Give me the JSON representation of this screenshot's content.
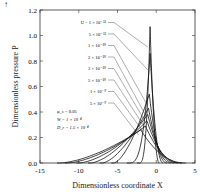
{
  "chart_data": {
    "type": "line",
    "title": "",
    "xlabel": "Dimensionless coordinate X",
    "ylabel": "Dimensionless pressure P",
    "xlim": [
      -15,
      5
    ],
    "ylim": [
      0,
      1.2
    ],
    "x_ticks": [
      "-15",
      "-10",
      "-5",
      "0",
      "5"
    ],
    "y_ticks": [
      "0.0",
      "0.2",
      "0.4",
      "0.6",
      "0.8",
      "1.0",
      "1.2"
    ],
    "grid": false,
    "legend_position": "inline labels top-right with leader lines",
    "annotations": [
      "φ_s = 0.05",
      "W = 1 × 10⁻⁴",
      "D_r = 1.5 × 10⁻⁴"
    ],
    "series": [
      {
        "name": "U = 1 × 10⁻¹¹",
        "peak_x": -0.8,
        "peak_y": 1.07,
        "start_x": -2.2
      },
      {
        "name": "5 × 10⁻¹¹",
        "peak_x": -0.8,
        "peak_y": 0.86,
        "start_x": -3.5
      },
      {
        "name": "1 × 10⁻¹⁰",
        "peak_x": -0.9,
        "peak_y": 0.54,
        "start_x": -5.5
      },
      {
        "name": "2 × 10⁻¹⁰",
        "peak_x": -1.0,
        "peak_y": 0.43,
        "start_x": -7.0
      },
      {
        "name": "3 × 10⁻¹⁰",
        "peak_x": -1.1,
        "peak_y": 0.38,
        "start_x": -8.5
      },
      {
        "name": "5 × 10⁻¹⁰",
        "peak_x": -1.2,
        "peak_y": 0.33,
        "start_x": -10.0
      },
      {
        "name": "1 × 10⁻⁹",
        "peak_x": -1.4,
        "peak_y": 0.29,
        "start_x": -11.5
      },
      {
        "name": "5 × 10⁻⁹",
        "peak_x": -2.0,
        "peak_y": 0.26,
        "start_x": -12.5
      }
    ]
  },
  "labels": {
    "arrow": "↑",
    "xlabel": "Dimensionless coordinate X",
    "ylabel": "Dimensionless pressure P"
  }
}
